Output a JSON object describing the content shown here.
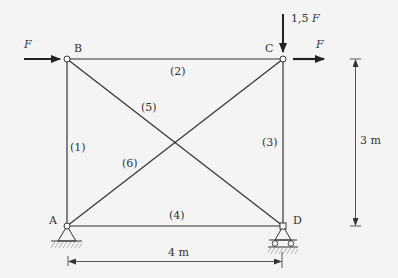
{
  "diagram": {
    "type": "planar truss",
    "nodes": {
      "A": {
        "label": "A",
        "support": "pin"
      },
      "B": {
        "label": "B"
      },
      "C": {
        "label": "C"
      },
      "D": {
        "label": "D",
        "support": "roller"
      }
    },
    "members": [
      {
        "id": "(1)",
        "from": "A",
        "to": "B"
      },
      {
        "id": "(2)",
        "from": "B",
        "to": "C"
      },
      {
        "id": "(3)",
        "from": "C",
        "to": "D"
      },
      {
        "id": "(4)",
        "from": "A",
        "to": "D"
      },
      {
        "id": "(5)",
        "from": "B",
        "to": "D"
      },
      {
        "id": "(6)",
        "from": "A",
        "to": "C"
      }
    ],
    "loads": {
      "at_B": "F",
      "at_C_horizontal": "F",
      "at_C_vertical": "1,5 F"
    },
    "loads_parts": {
      "c_vert_num": "1,5 ",
      "c_vert_sym": "F"
    },
    "dimensions": {
      "width": "4 m",
      "height": "3 m"
    }
  }
}
